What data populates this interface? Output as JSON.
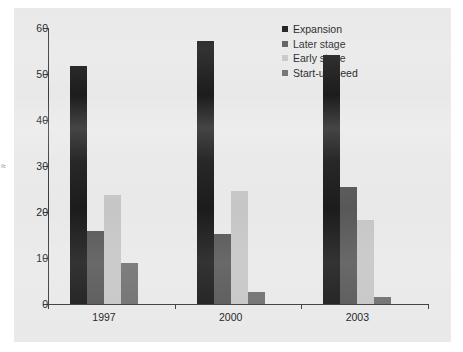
{
  "figure": {
    "background": "#e9e9e9",
    "plot_background": "#e9e9e9"
  },
  "chart_data": {
    "type": "bar",
    "title": "",
    "subtitle": "",
    "xlabel": "",
    "ylabel": "",
    "categories": [
      "1997",
      "2000",
      "2003"
    ],
    "series": [
      {
        "name": "Expansion",
        "color": "#1c1c1c",
        "values": [
          51.7,
          57.2,
          54.2
        ]
      },
      {
        "name": "Later stage",
        "color": "#585858",
        "values": [
          15.8,
          15.2,
          25.5
        ]
      },
      {
        "name": "Early stage",
        "color": "#c6c6c6",
        "values": [
          23.6,
          24.5,
          18.2
        ]
      },
      {
        "name": "Start-up/Seed",
        "color": "#707070",
        "values": [
          8.9,
          2.6,
          1.6
        ]
      }
    ],
    "ylim": [
      0,
      60
    ],
    "yticks": [
      0,
      10,
      20,
      30,
      40,
      50,
      60
    ],
    "ytick_labels": [
      "0",
      "10",
      "20",
      "30",
      "40",
      "50",
      "60"
    ],
    "grid": false,
    "legend_position": "top-right",
    "legend_entries": [
      "Expansion",
      "Later stage",
      "Early stage",
      "Start-up/Seed"
    ]
  },
  "margin_artifact": "≈"
}
